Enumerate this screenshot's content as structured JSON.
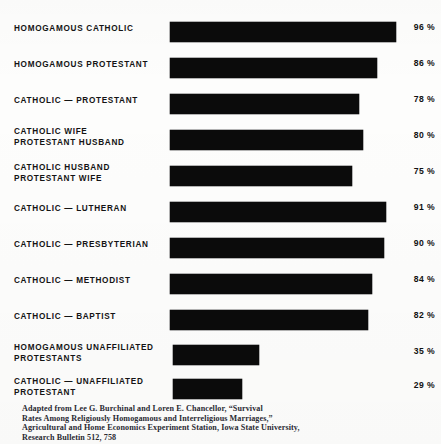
{
  "figure": {
    "background_color": "#fdfdfc",
    "bar_color": "#0b0b0b",
    "text_color": "#141414"
  },
  "chart_data": {
    "type": "bar",
    "orientation": "horizontal",
    "title": "",
    "subtitle": "",
    "xlabel": "",
    "ylabel": "",
    "xlim": [
      0,
      100
    ],
    "grid": false,
    "legend": null,
    "value_suffix": "%",
    "categories": [
      "HOMOGAMOUS CATHOLIC",
      "HOMOGAMOUS PROTESTANT",
      "CATHOLIC — PROTESTANT",
      "CATHOLIC WIFE\nPROTESTANT HUSBAND",
      "CATHOLIC HUSBAND\nPROTESTANT WIFE",
      "CATHOLIC — LUTHERAN",
      "CATHOLIC — PRESBYTERIAN",
      "CATHOLIC — METHODIST",
      "CATHOLIC — BAPTIST",
      "HOMOGAMOUS UNAFFILIATED\nPROTESTANTS",
      "CATHOLIC — UNAFFILIATED\nPROTESTANT"
    ],
    "values": [
      96,
      86,
      78,
      80,
      75,
      91,
      90,
      84,
      82,
      35,
      29
    ],
    "value_labels": [
      "96 %",
      "86 %",
      "78 %",
      "80 %",
      "75 %",
      "91 %",
      "90 %",
      "84 %",
      "82 %",
      "35 %",
      "29 %"
    ]
  },
  "rows": [
    {
      "label": "HOMOGAMOUS CATHOLIC",
      "value_label": "96 %",
      "bar_width_px": 226
    },
    {
      "label": "HOMOGAMOUS PROTESTANT",
      "value_label": "86 %",
      "bar_width_px": 207
    },
    {
      "label": "CATHOLIC — PROTESTANT",
      "value_label": "78 %",
      "bar_width_px": 189
    },
    {
      "label": "CATHOLIC WIFE\nPROTESTANT HUSBAND",
      "value_label": "80 %",
      "bar_width_px": 193
    },
    {
      "label": "CATHOLIC HUSBAND\nPROTESTANT WIFE",
      "value_label": "75 %",
      "bar_width_px": 182
    },
    {
      "label": "CATHOLIC — LUTHERAN",
      "value_label": "91 %",
      "bar_width_px": 216
    },
    {
      "label": "CATHOLIC — PRESBYTERIAN",
      "value_label": "90 %",
      "bar_width_px": 214
    },
    {
      "label": "CATHOLIC — METHODIST",
      "value_label": "84 %",
      "bar_width_px": 202
    },
    {
      "label": "CATHOLIC — BAPTIST",
      "value_label": "82 %",
      "bar_width_px": 198
    },
    {
      "label": "HOMOGAMOUS UNAFFILIATED\nPROTESTANTS",
      "value_label": "35 %",
      "bar_width_px": 86
    },
    {
      "label": "CATHOLIC — UNAFFILIATED\nPROTESTANT",
      "value_label": "29 %",
      "bar_width_px": 69
    }
  ],
  "caption": {
    "lines": [
      "Adapted from Lee G. Burchinal and Loren E. Chancellor, “Survival",
      "Rates Among Religiously Homogamous and Interreligious Marriages,”",
      "Agricultural and Home Economics Experiment Station, Iowa State University,",
      "Research Bulletin 512, 758"
    ]
  }
}
